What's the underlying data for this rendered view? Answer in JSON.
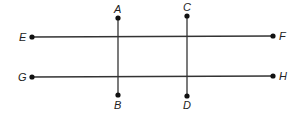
{
  "diagram": {
    "type": "geometry-lines",
    "colors": {
      "line": "#333333",
      "point": "#111111",
      "label": "#222222",
      "background": "#ffffff"
    },
    "points": {
      "A": {
        "label": "A",
        "x": 118,
        "y": 18
      },
      "B": {
        "label": "B",
        "x": 118,
        "y": 95
      },
      "C": {
        "label": "C",
        "x": 187,
        "y": 16
      },
      "D": {
        "label": "D",
        "x": 187,
        "y": 96
      },
      "E": {
        "label": "E",
        "x": 32,
        "y": 37
      },
      "F": {
        "label": "F",
        "x": 273,
        "y": 36
      },
      "G": {
        "label": "G",
        "x": 32,
        "y": 77
      },
      "H": {
        "label": "H",
        "x": 273,
        "y": 76
      }
    },
    "segments": [
      {
        "name": "EF",
        "from": "E",
        "to": "F"
      },
      {
        "name": "GH",
        "from": "G",
        "to": "H"
      },
      {
        "name": "AB",
        "from": "A",
        "to": "B"
      },
      {
        "name": "CD",
        "from": "C",
        "to": "D"
      }
    ]
  }
}
